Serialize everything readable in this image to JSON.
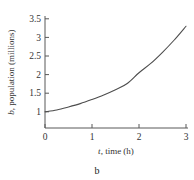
{
  "chart_data": {
    "type": "line",
    "title": "",
    "subtitle": "",
    "xlabel": "t, time (h)",
    "xlabel_italic_part": "t",
    "xlabel_rest": ", time (h)",
    "ylabel": "b, population (millions)",
    "ylabel_italic_part": "b",
    "ylabel_rest": ", population (millions)",
    "xlim": [
      0,
      3
    ],
    "ylim": [
      1,
      3.5
    ],
    "xticks": [
      "0",
      "1",
      "2",
      "3"
    ],
    "xtick_values": [
      0,
      1,
      2,
      3
    ],
    "yticks": [
      "1",
      "1.5",
      "2",
      "2.5",
      "3",
      "3.5"
    ],
    "ytick_values": [
      1,
      1.5,
      2,
      2.5,
      3,
      3.5
    ],
    "grid": false,
    "legend": false,
    "legend_position": "none",
    "series": [
      {
        "name": "population",
        "x": [
          0,
          0.25,
          0.5,
          0.75,
          1,
          1.25,
          1.5,
          1.75,
          2,
          2.25,
          2.5,
          2.75,
          3
        ],
        "values": [
          1.0,
          1.05,
          1.13,
          1.22,
          1.33,
          1.45,
          1.59,
          1.76,
          2.05,
          2.3,
          2.6,
          2.93,
          3.3
        ]
      }
    ],
    "curve_color": "#4d4d4d",
    "axis_color": "#595959",
    "text_color": "#333333"
  },
  "caption": {
    "label": "b"
  }
}
